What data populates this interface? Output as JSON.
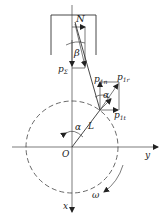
{
  "diagram": {
    "colors": {
      "stroke": "#333333",
      "background": "#ffffff"
    },
    "labels": {
      "N": "N",
      "beta": "β",
      "p_sigma": "p",
      "p_sigma_sub": "Σ",
      "p1n": "p",
      "p1n_sub": "1n",
      "p1": "p",
      "p1_sub": "1r",
      "p1t": "p",
      "p1t_sub": "1t",
      "alpha_top": "α",
      "alpha_origin": "α",
      "L": "L",
      "O": "O",
      "y_axis": "y",
      "x_axis": "x",
      "omega": "ω"
    }
  }
}
